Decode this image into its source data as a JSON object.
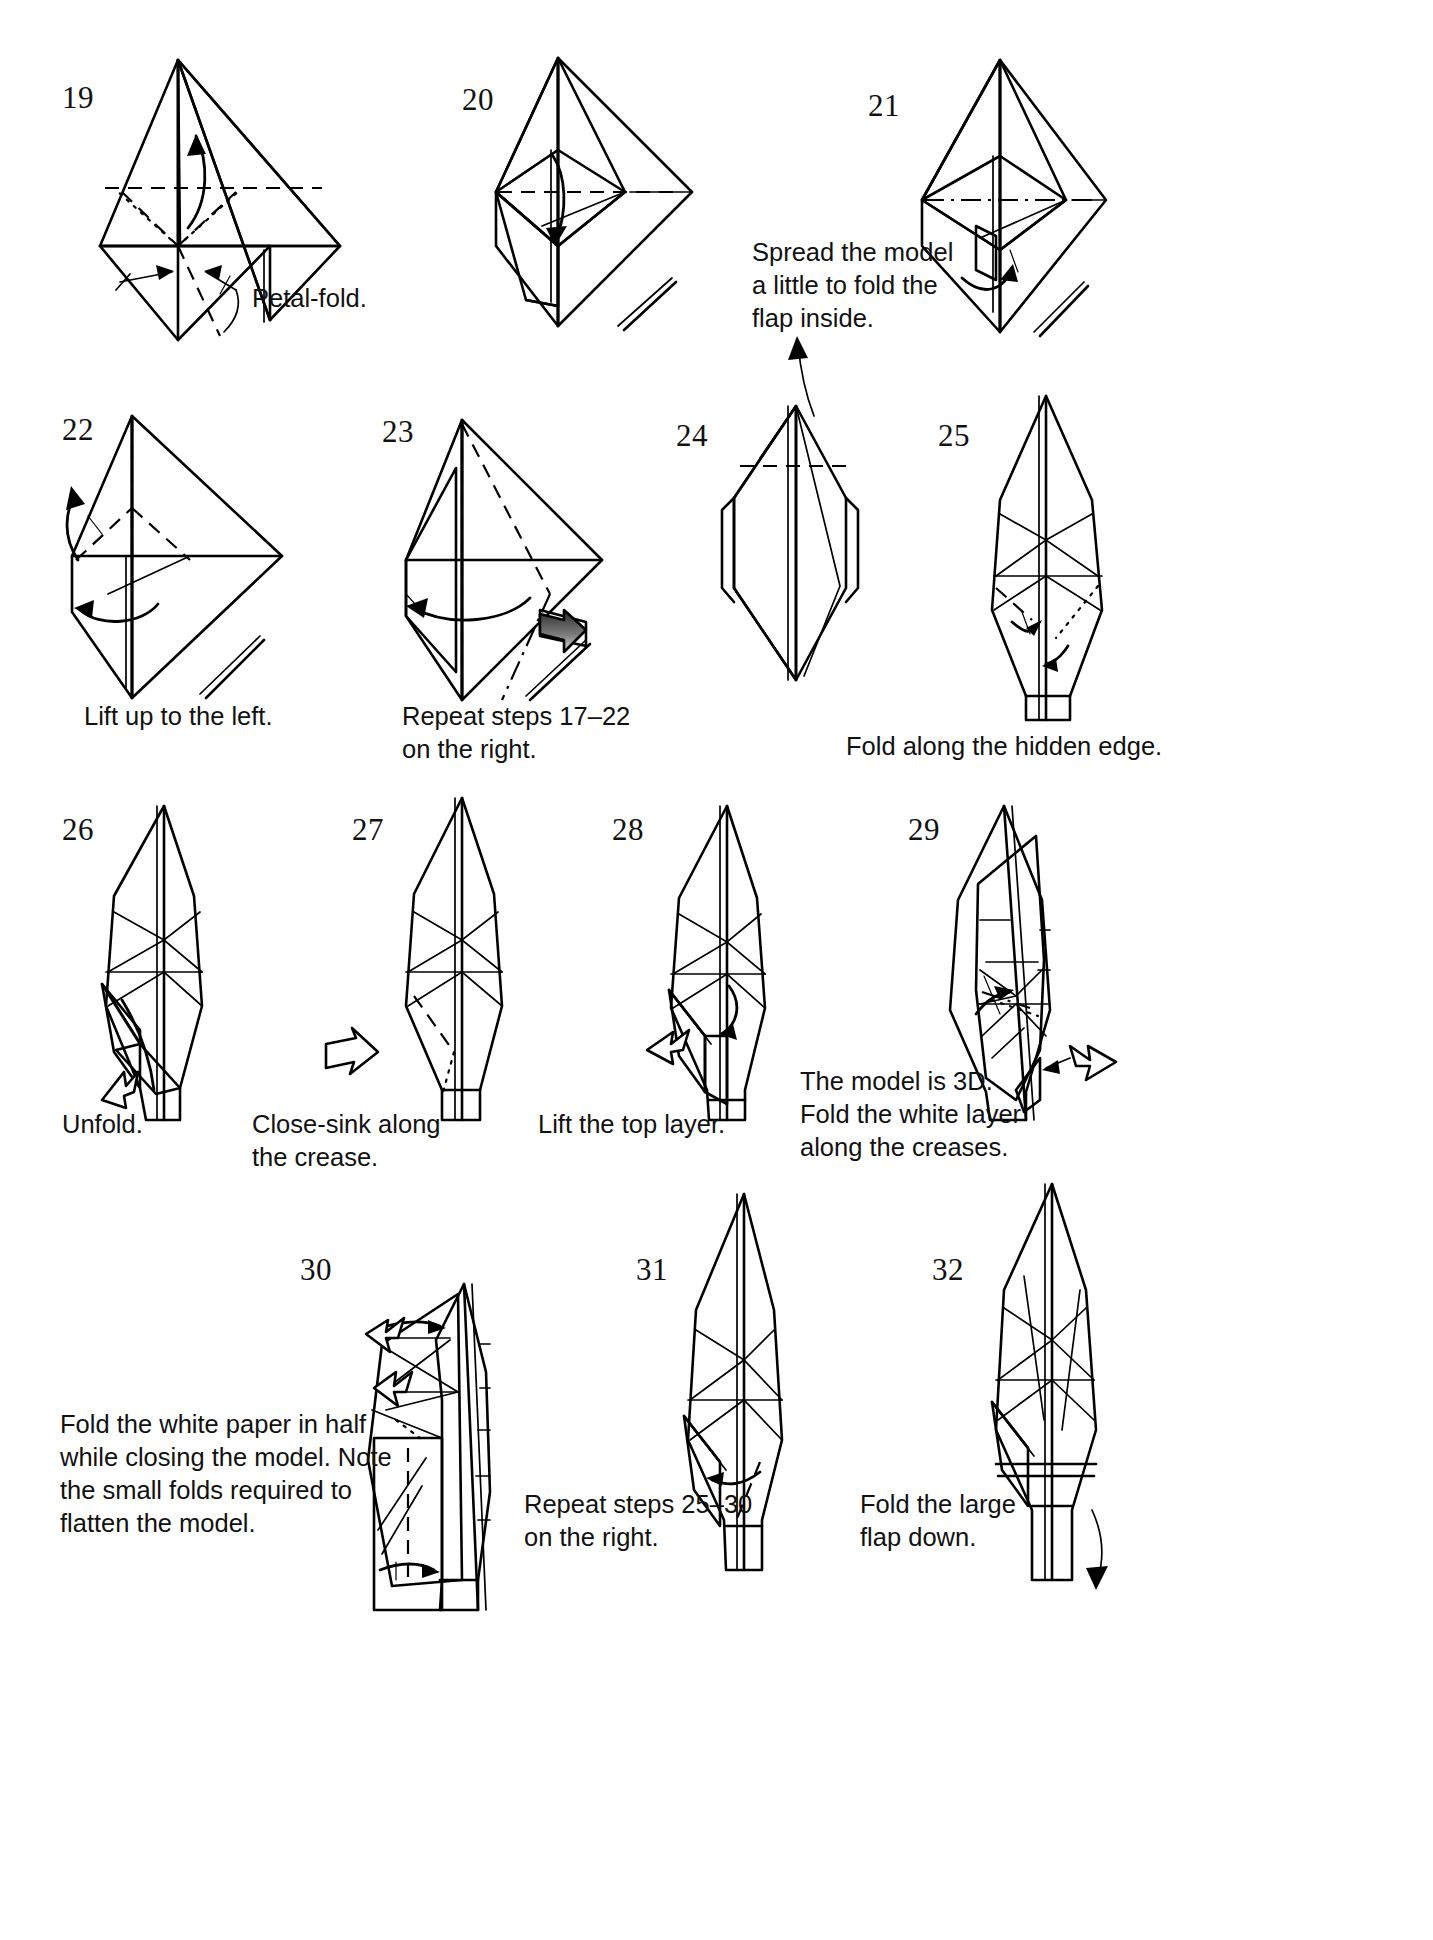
{
  "page": {
    "kind": "origami-instruction-diagram",
    "background_color": "#ffffff",
    "paper_fill_color": "#9a9a9a",
    "paper_white_color": "#ffffff",
    "line_color": "#000000"
  },
  "steps": [
    {
      "id": "19",
      "number": "19",
      "caption": "Petal-fold."
    },
    {
      "id": "20",
      "number": "20",
      "caption": ""
    },
    {
      "id": "21",
      "number": "21",
      "caption": "Spread the model\na little to fold the\nflap inside."
    },
    {
      "id": "22",
      "number": "22",
      "caption": "Lift up to the left."
    },
    {
      "id": "23",
      "number": "23",
      "caption": "Repeat steps 17–22\non the right."
    },
    {
      "id": "24",
      "number": "24",
      "caption": ""
    },
    {
      "id": "25",
      "number": "25",
      "caption": "Fold along the hidden edge."
    },
    {
      "id": "26",
      "number": "26",
      "caption": "Unfold."
    },
    {
      "id": "27",
      "number": "27",
      "caption": "Close-sink along\nthe crease."
    },
    {
      "id": "28",
      "number": "28",
      "caption": "Lift the top layer."
    },
    {
      "id": "29",
      "number": "29",
      "caption": "The model is 3D.\nFold the white layer\nalong the creases."
    },
    {
      "id": "30",
      "number": "30",
      "caption": "Fold the white paper in half\nwhile closing the model. Note\nthe small folds required to\nflatten the model."
    },
    {
      "id": "31",
      "number": "31",
      "caption": "Repeat steps 25–30\non the right."
    },
    {
      "id": "32",
      "number": "32",
      "caption": "Fold the large\nflap down."
    }
  ]
}
